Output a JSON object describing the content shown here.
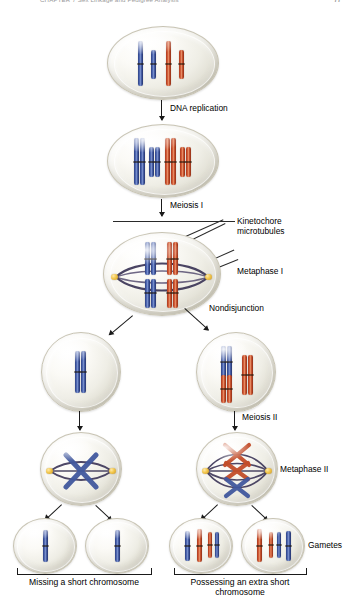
{
  "runhead": {
    "title": "CHAPTER 7   Sex Linkage and Pedigree Analysis",
    "page": "77"
  },
  "figure": {
    "type": "meiosis-nondisjunction-diagram",
    "labels": {
      "dna_replication": "DNA replication",
      "meiosis_i": "Meiosis I",
      "kinetochore_microtubules": "Kinetochore microtubules",
      "metaphase_i": "Metaphase I",
      "nondisjunction": "Nondisjunction",
      "meiosis_ii": "Meiosis II",
      "metaphase_ii": "Metaphase II",
      "gametes": "Gametes"
    },
    "captions": {
      "left": "Missing a short chromosome",
      "right": "Possessing an extra short chromosome"
    },
    "colors": {
      "blue_chromosome": "#3a4f95",
      "red_chromosome": "#c24d2a",
      "centrosome": "#f2c64a",
      "spindle_fiber": "#3b3456",
      "cell_fill": "#efeee6",
      "text": "#000000"
    },
    "stages": [
      {
        "name": "parent-cell",
        "description": "Diploid parent cell before replication",
        "chromosomes": [
          {
            "color": "blue",
            "length": "long"
          },
          {
            "color": "blue",
            "length": "short"
          },
          {
            "color": "red",
            "length": "long"
          },
          {
            "color": "red",
            "length": "short"
          }
        ]
      },
      {
        "name": "replicated-cell",
        "description": "After DNA replication, each chromosome is a pair of sister chromatids",
        "chromosomes": [
          {
            "color": "blue",
            "length": "long",
            "chromatids": 2
          },
          {
            "color": "blue",
            "length": "short",
            "chromatids": 2
          },
          {
            "color": "red",
            "length": "long",
            "chromatids": 2
          },
          {
            "color": "red",
            "length": "short",
            "chromatids": 2
          }
        ]
      },
      {
        "name": "metaphase-i-cell",
        "description": "Homologous pairs aligned at metaphase plate with kinetochore microtubules",
        "chromosomes": [
          {
            "color": "blue",
            "length": "long",
            "chromatids": 2
          },
          {
            "color": "red",
            "length": "long",
            "chromatids": 2
          },
          {
            "color": "blue",
            "length": "short",
            "chromatids": 2
          },
          {
            "color": "red",
            "length": "short",
            "chromatids": 2
          }
        ]
      },
      {
        "name": "daughter-cell-left",
        "description": "Daughter cell lacking the short chromosome pair",
        "chromosomes": [
          {
            "color": "blue",
            "length": "long",
            "chromatids": 2
          }
        ]
      },
      {
        "name": "daughter-cell-right",
        "description": "Daughter cell with an extra short chromosome from nondisjunction",
        "chromosomes": [
          {
            "color": "blue",
            "length": "long",
            "chromatids": 2
          },
          {
            "color": "red",
            "length": "short",
            "chromatids": 2
          },
          {
            "color": "red",
            "length": "long",
            "chromatids": 2
          }
        ]
      },
      {
        "name": "metaphase-ii-cell-left",
        "description": "Metaphase II with one X-shaped chromosome",
        "chromosomes": [
          {
            "color": "blue",
            "length": "long",
            "chromatids": 2
          }
        ]
      },
      {
        "name": "metaphase-ii-cell-right",
        "description": "Metaphase II with three X-shaped chromosomes",
        "chromosomes": [
          {
            "color": "red",
            "length": "long",
            "chromatids": 2
          },
          {
            "color": "red",
            "length": "short",
            "chromatids": 2
          },
          {
            "color": "blue",
            "length": "long",
            "chromatids": 2
          }
        ]
      },
      {
        "name": "gamete-1",
        "description": "Gamete missing a short chromosome",
        "chromosomes": [
          {
            "color": "blue",
            "length": "long"
          }
        ]
      },
      {
        "name": "gamete-2",
        "description": "Gamete missing a short chromosome",
        "chromosomes": [
          {
            "color": "blue",
            "length": "long"
          }
        ]
      },
      {
        "name": "gamete-3",
        "description": "Gamete possessing an extra short chromosome",
        "chromosomes": [
          {
            "color": "blue",
            "length": "long"
          },
          {
            "color": "red",
            "length": "long"
          },
          {
            "color": "red",
            "length": "short"
          }
        ]
      },
      {
        "name": "gamete-4",
        "description": "Gamete possessing an extra short chromosome",
        "chromosomes": [
          {
            "color": "red",
            "length": "long"
          },
          {
            "color": "red",
            "length": "short"
          },
          {
            "color": "blue",
            "length": "long"
          }
        ]
      }
    ]
  }
}
